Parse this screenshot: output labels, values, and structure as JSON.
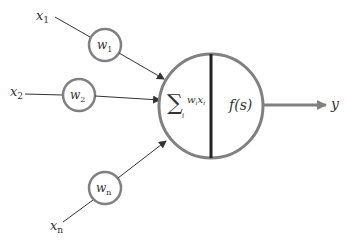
{
  "diagram": {
    "inputs": [
      {
        "label": "x",
        "sub": "1",
        "weight": "w",
        "weight_sub": "1"
      },
      {
        "label": "x",
        "sub": "2",
        "weight": "w",
        "weight_sub": "2"
      },
      {
        "label": "x",
        "sub": "n",
        "weight": "w",
        "weight_sub": "n"
      }
    ],
    "neuron": {
      "sum_symbol": "∑",
      "sum_index": "i",
      "sum_term": "w",
      "sum_term_sub": "i",
      "sum_term2": "x",
      "sum_term2_sub": "i",
      "activation": "f(s)"
    },
    "output": {
      "label": "y"
    },
    "colors": {
      "circle_stroke": "#808080",
      "divider": "#222222",
      "arrow": "#333333",
      "output_arrow": "#808080",
      "text": "#333333"
    }
  }
}
